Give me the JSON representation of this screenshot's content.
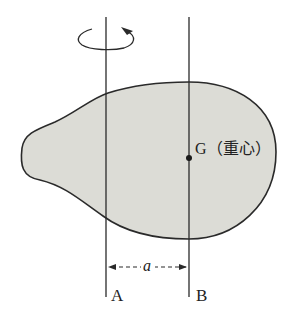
{
  "diagram": {
    "type": "parallel-axis-theorem",
    "labels": {
      "axis_a": "A",
      "axis_b": "B",
      "center_of_mass": "G（重心）",
      "distance": "a"
    },
    "colors": {
      "body_fill": "#dcdcd6",
      "stroke": "#2a2a2a",
      "background": "#ffffff"
    },
    "elements": {
      "rigid_body": "teardrop-shaped rigid body (shaded)",
      "axis_a": "vertical rotation axis A with rotation arrow",
      "axis_b": "vertical axis B through center of mass G",
      "distance_arrow": "dashed double-headed arrow between A and B labelled a"
    }
  }
}
